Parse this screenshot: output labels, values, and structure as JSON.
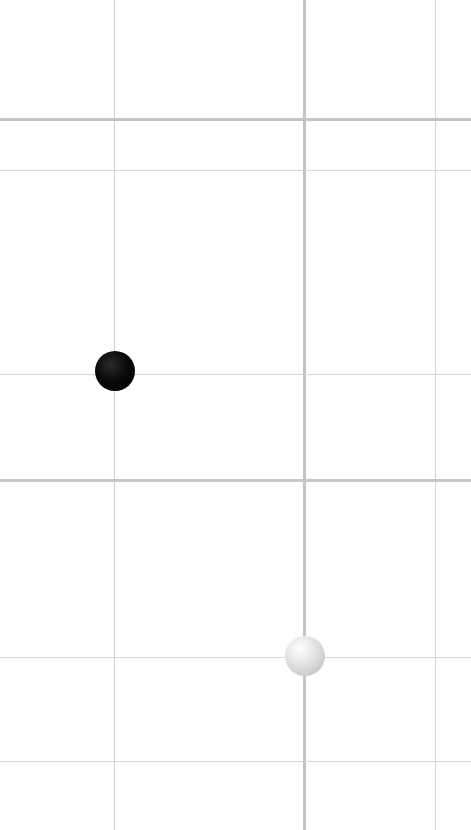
{
  "board": {
    "background": "#ffffff",
    "width": 471,
    "height": 830,
    "vertical_lines": [
      {
        "x": 114,
        "width": 1,
        "color": "#cfcfcf"
      },
      {
        "x": 304,
        "width": 3,
        "color": "#c4c4c4"
      },
      {
        "x": 435,
        "width": 1,
        "color": "#d6d6d6"
      }
    ],
    "horizontal_lines": [
      {
        "y": 119,
        "width": 3,
        "color": "#c4c4c4"
      },
      {
        "y": 170,
        "width": 1,
        "color": "#d6d6d6"
      },
      {
        "y": 374,
        "width": 1,
        "color": "#d6d6d6"
      },
      {
        "y": 480,
        "width": 3,
        "color": "#c8c8c8"
      },
      {
        "y": 657,
        "width": 1,
        "color": "#d6d6d6"
      },
      {
        "y": 761,
        "width": 1,
        "color": "#d6d6d6"
      }
    ]
  },
  "stones": [
    {
      "color": "black",
      "x": 115,
      "y": 371,
      "diameter": 40
    },
    {
      "color": "white",
      "x": 305,
      "y": 656,
      "diameter": 40
    }
  ]
}
